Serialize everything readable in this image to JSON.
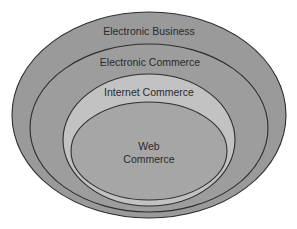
{
  "diagram": {
    "type": "nested-ellipses",
    "colors": {
      "background": "#ffffff",
      "outer_fill": "#9a9a9a",
      "middle_fill": "#9d9d9d",
      "internet_fill": "#c2c2c2",
      "inner_fill": "#a6a6a6",
      "stroke": "#2e2e2e",
      "text": "#2a2a2a"
    },
    "layers": [
      {
        "label": "Electronic Business"
      },
      {
        "label": "Electronic Commerce"
      },
      {
        "label": "Internet Commerce"
      },
      {
        "label_line1": "Web",
        "label_line2": "Commerce"
      }
    ]
  }
}
